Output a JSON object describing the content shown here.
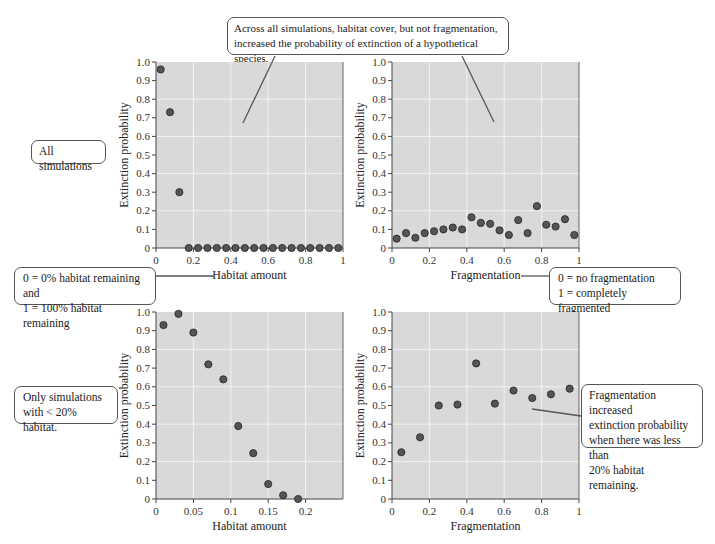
{
  "callouts": {
    "top": "Across all simulations, habitat cover, but not fragmentation, increased the probability of extinction of a hypothetical species.",
    "top_line1": "Across all simulations, habitat cover, but not fragmentation,",
    "top_line2": "increased the probability of extinction of a hypothetical species.",
    "all_sims": "All simulations",
    "habitat_def_line1": "0 = 0% habitat remaining and",
    "habitat_def_line2": "1 = 100% habitat remaining",
    "frag_def_line1": "0 = no fragmentation",
    "frag_def_line2": "1 = completely fragmented",
    "only_sims_line1": "Only simulations",
    "only_sims_line2": "with < 20% habitat.",
    "frag_inc_line1": "Fragmentation increased",
    "frag_inc_line2": "extinction probability",
    "frag_inc_line3": "when there was less than",
    "frag_inc_line4": "20% habitat remaining."
  },
  "colors": {
    "plot_bg": "#d9d9d9",
    "grid": "#f2f2f2",
    "point": "#555555",
    "point_edge": "#222222"
  },
  "chart_data": [
    {
      "type": "scatter",
      "title": "All simulations",
      "xlabel": "Habitat amount",
      "ylabel": "Extinction probability",
      "xlim": [
        0,
        1
      ],
      "ylim": [
        0,
        1.0
      ],
      "xticks": [
        "0",
        "0.2",
        "0.4",
        "0.6",
        "0.8",
        "1"
      ],
      "yticks": [
        "0",
        "0.1",
        "0.2",
        "0.3",
        "0.4",
        "0.5",
        "0.6",
        "0.7",
        "0.8",
        "0.9",
        "1.0"
      ],
      "x": [
        0.025,
        0.075,
        0.125,
        0.175,
        0.225,
        0.275,
        0.325,
        0.375,
        0.425,
        0.475,
        0.525,
        0.575,
        0.625,
        0.675,
        0.725,
        0.775,
        0.825,
        0.875,
        0.925,
        0.975
      ],
      "y": [
        0.96,
        0.73,
        0.3,
        0,
        0,
        0,
        0,
        0,
        0,
        0,
        0,
        0,
        0,
        0,
        0,
        0,
        0,
        0,
        0,
        0
      ]
    },
    {
      "type": "scatter",
      "title": "All simulations",
      "xlabel": "Fragmentation",
      "ylabel": "Extinction probability",
      "xlim": [
        0,
        1
      ],
      "ylim": [
        0,
        1.0
      ],
      "xticks": [
        "0",
        "0.2",
        "0.4",
        "0.6",
        "0.8",
        "1"
      ],
      "yticks": [
        "0",
        "0.1",
        "0.2",
        "0.3",
        "0.4",
        "0.5",
        "0.6",
        "0.7",
        "0.8",
        "0.9",
        "1.0"
      ],
      "x": [
        0.025,
        0.075,
        0.125,
        0.175,
        0.225,
        0.275,
        0.325,
        0.375,
        0.425,
        0.475,
        0.525,
        0.575,
        0.625,
        0.675,
        0.725,
        0.775,
        0.825,
        0.875,
        0.925,
        0.975
      ],
      "y": [
        0.05,
        0.08,
        0.055,
        0.08,
        0.09,
        0.1,
        0.11,
        0.1,
        0.165,
        0.135,
        0.13,
        0.095,
        0.07,
        0.15,
        0.08,
        0.225,
        0.125,
        0.115,
        0.155,
        0.07
      ]
    },
    {
      "type": "scatter",
      "title": "Only simulations with < 20% habitat.",
      "xlabel": "Habitat amount",
      "ylabel": "Extinction probability",
      "xlim": [
        0,
        0.25
      ],
      "ylim": [
        0,
        1.0
      ],
      "xticks": [
        "0",
        "0.05",
        "0.1",
        "0.15",
        "0.2"
      ],
      "yticks": [
        "0",
        "0.1",
        "0.2",
        "0.3",
        "0.4",
        "0.5",
        "0.6",
        "0.7",
        "0.8",
        "0.9",
        "1.0"
      ],
      "x": [
        0.01,
        0.03,
        0.05,
        0.07,
        0.09,
        0.11,
        0.13,
        0.15,
        0.17,
        0.19
      ],
      "y": [
        0.93,
        0.99,
        0.89,
        0.72,
        0.64,
        0.39,
        0.245,
        0.08,
        0.02,
        0.0
      ]
    },
    {
      "type": "scatter",
      "title": "Only simulations with < 20% habitat.",
      "xlabel": "Fragmentation",
      "ylabel": "Extinction probability",
      "xlim": [
        0,
        1
      ],
      "ylim": [
        0,
        1.0
      ],
      "xticks": [
        "0",
        "0.2",
        "0.4",
        "0.6",
        "0.8",
        "1"
      ],
      "yticks": [
        "0",
        "0.1",
        "0.2",
        "0.3",
        "0.4",
        "0.5",
        "0.6",
        "0.7",
        "0.8",
        "0.9",
        "1.0"
      ],
      "x": [
        0.05,
        0.15,
        0.25,
        0.35,
        0.45,
        0.55,
        0.65,
        0.75,
        0.85,
        0.95
      ],
      "y": [
        0.25,
        0.33,
        0.5,
        0.505,
        0.725,
        0.51,
        0.58,
        0.54,
        0.56,
        0.59
      ]
    }
  ]
}
